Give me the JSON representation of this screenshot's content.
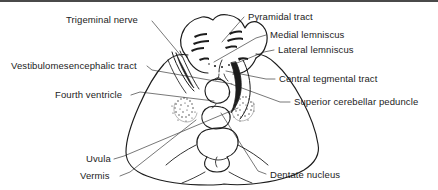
{
  "figure": {
    "width": 438,
    "height": 190,
    "background_color": "#ffffff",
    "line_color": "#1c1c1c",
    "leader_color": "#555555",
    "border_color": "#4a4a4a"
  },
  "labels": {
    "trigeminal_nerve": "Trigeminal nerve",
    "vestibulomesencephalic_tract": "Vestibulomesencephalic tract",
    "fourth_ventricle": "Fourth ventricle",
    "uvula": "Uvula",
    "vermis": "Vermis",
    "pyramidal_tract": "Pyramidal tract",
    "medial_lemniscus": "Medial lemniscus",
    "lateral_lemniscus": "Lateral lemniscus",
    "central_tegmental_tract": "Central tegmental tract",
    "superior_cerebellar_peduncle": "Superior cerebellar peduncle",
    "dentate_nucleus": "Dentate nucleus"
  },
  "structures": [
    {
      "name": "pons",
      "side": "anterior"
    },
    {
      "name": "cerebellum",
      "side": "posterior"
    },
    {
      "name": "fourth-ventricle",
      "side": "midline"
    },
    {
      "name": "vermis",
      "side": "midline"
    },
    {
      "name": "dentate-nucleus-left",
      "side": "left"
    },
    {
      "name": "dentate-nucleus-right",
      "side": "right"
    },
    {
      "name": "superior-cerebellar-peduncle",
      "side": "right"
    },
    {
      "name": "trigeminal-nerve-root",
      "side": "left"
    }
  ]
}
